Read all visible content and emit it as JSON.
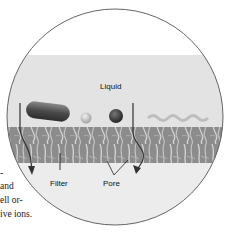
{
  "figure": {
    "type": "filtration-magnified-view",
    "labels": {
      "liquid": "Liquid",
      "filter": "Filter",
      "pore": "Pore"
    },
    "particles": [
      "rod-shaped bacterium",
      "small sphere",
      "dark sphere",
      "wavy strand"
    ],
    "colors": {
      "outline": "#555555",
      "liquid_band": "#e3e3e3",
      "filter_band": "#8a8a8a",
      "below_filter": "#ececec",
      "arrow": "#333333"
    }
  },
  "side_text": {
    "lines": [
      "-",
      "and",
      "ell or-",
      "ive ions."
    ]
  }
}
